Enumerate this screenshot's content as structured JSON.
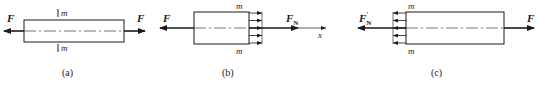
{
  "figure": {
    "panels": [
      {
        "id": "a",
        "caption": "(a)",
        "force_left_label": "F",
        "force_right_label": "F",
        "section_label_top": "m",
        "section_label_bottom": "m"
      },
      {
        "id": "b",
        "caption": "(b)",
        "force_left_label": "F",
        "internal_force_label": "F",
        "internal_force_subscript": "N",
        "axis_label": "x",
        "section_label_top": "m",
        "section_label_bottom": "m"
      },
      {
        "id": "c",
        "caption": "(c)",
        "internal_force_label": "F",
        "internal_force_subscript": "N",
        "internal_force_prime": "'",
        "force_right_label": "F",
        "section_label_top": "m",
        "section_label_bottom": "m"
      }
    ],
    "colors": {
      "stroke": "#1a1a1a",
      "background": "#ffffff"
    }
  }
}
